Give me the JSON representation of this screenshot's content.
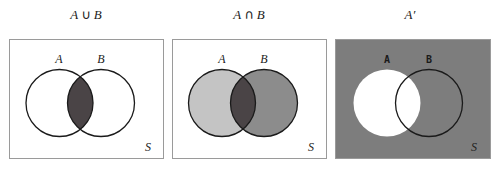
{
  "figure": {
    "panels": [
      {
        "title_set_a": "A",
        "title_op": "∪",
        "title_set_b": "B",
        "label_a": "A",
        "label_b": "B",
        "universe_label": "S",
        "fills": {
          "background": "#ffffff",
          "only_a": "#ffffff",
          "only_b": "#ffffff",
          "intersection": "#4a4446"
        }
      },
      {
        "title_set_a": "A",
        "title_op": "∩",
        "title_set_b": "B",
        "label_a": "A",
        "label_b": "B",
        "universe_label": "S",
        "fills": {
          "background": "#ffffff",
          "only_a": "#c4c4c4",
          "only_b": "#8c8c8c",
          "intersection": "#4a4446"
        }
      },
      {
        "title": "A′",
        "label_a": "A",
        "label_b": "B",
        "universe_label": "S",
        "fills": {
          "background": "#7d7d7d",
          "set_a": "#ffffff"
        }
      }
    ],
    "colors": {
      "box_border": "#9a9a9a",
      "circle_stroke": "#1a1a1a"
    }
  }
}
